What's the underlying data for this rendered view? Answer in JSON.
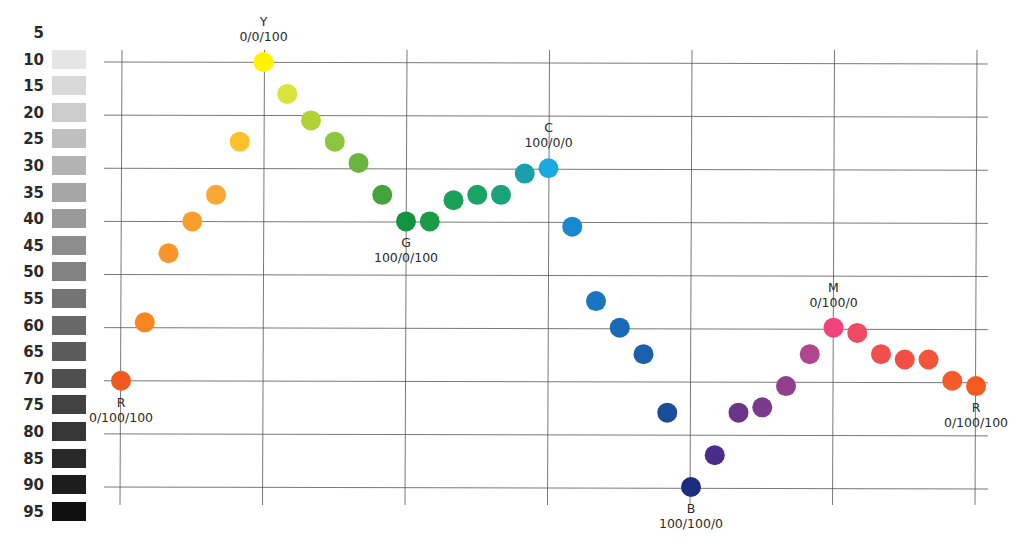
{
  "chart_data": {
    "type": "scatter",
    "title": "",
    "xlabel": "",
    "ylabel": "Lightness / grey value (%)",
    "grid": true,
    "legend": "none",
    "y_scale_labels": [
      "5",
      "10",
      "15",
      "20",
      "25",
      "30",
      "35",
      "40",
      "45",
      "50",
      "55",
      "60",
      "65",
      "70",
      "75",
      "80",
      "85",
      "90",
      "95"
    ],
    "ylim": [
      5,
      95
    ],
    "x_gridlines": 7,
    "y_gridlines": [
      10,
      20,
      30,
      40,
      50,
      60,
      70,
      80,
      90
    ],
    "annotations": [
      {
        "name": "R",
        "cmy": "0/100/100",
        "index": 0,
        "position": "below"
      },
      {
        "name": "Y",
        "cmy": "0/0/100",
        "index": 6,
        "position": "above"
      },
      {
        "name": "G",
        "cmy": "100/0/100",
        "index": 12,
        "position": "below"
      },
      {
        "name": "C",
        "cmy": "100/0/0",
        "index": 18,
        "position": "above"
      },
      {
        "name": "B",
        "cmy": "100/100/0",
        "index": 24,
        "position": "below"
      },
      {
        "name": "M",
        "cmy": "0/100/0",
        "index": 30,
        "position": "above"
      },
      {
        "name": "R",
        "cmy": "0/100/100",
        "index": 36,
        "position": "below"
      }
    ],
    "points": [
      {
        "x": 0,
        "y": 70,
        "color": "#f05a1e"
      },
      {
        "x": 1,
        "y": 59,
        "color": "#f7861f"
      },
      {
        "x": 2,
        "y": 46,
        "color": "#f8952a"
      },
      {
        "x": 3,
        "y": 40,
        "color": "#f99d2b"
      },
      {
        "x": 4,
        "y": 35,
        "color": "#faa832"
      },
      {
        "x": 5,
        "y": 25,
        "color": "#fcc12b"
      },
      {
        "x": 6,
        "y": 10,
        "color": "#fff200"
      },
      {
        "x": 7,
        "y": 16,
        "color": "#d5e33a"
      },
      {
        "x": 8,
        "y": 21,
        "color": "#b0d235"
      },
      {
        "x": 9,
        "y": 25,
        "color": "#8cc63f"
      },
      {
        "x": 10,
        "y": 29,
        "color": "#6bb43e"
      },
      {
        "x": 11,
        "y": 35,
        "color": "#45a33e"
      },
      {
        "x": 12,
        "y": 40,
        "color": "#10943f"
      },
      {
        "x": 13,
        "y": 40,
        "color": "#1b9a48"
      },
      {
        "x": 14,
        "y": 36,
        "color": "#1ba059"
      },
      {
        "x": 15,
        "y": 35,
        "color": "#1ba265"
      },
      {
        "x": 16,
        "y": 35,
        "color": "#1aa377"
      },
      {
        "x": 17,
        "y": 31,
        "color": "#1a9fab"
      },
      {
        "x": 18,
        "y": 30,
        "color": "#1aaae2"
      },
      {
        "x": 19,
        "y": 41,
        "color": "#1a88d0"
      },
      {
        "x": 20,
        "y": 55,
        "color": "#1a75c0"
      },
      {
        "x": 21,
        "y": 60,
        "color": "#1a6bb7"
      },
      {
        "x": 22,
        "y": 65,
        "color": "#1a60ad"
      },
      {
        "x": 23,
        "y": 76,
        "color": "#1a4d98"
      },
      {
        "x": 24,
        "y": 90,
        "color": "#1a2d80"
      },
      {
        "x": 25,
        "y": 84,
        "color": "#4a2d8a"
      },
      {
        "x": 26,
        "y": 76,
        "color": "#6a3488"
      },
      {
        "x": 27,
        "y": 75,
        "color": "#7a3a8c"
      },
      {
        "x": 28,
        "y": 71,
        "color": "#903f8c"
      },
      {
        "x": 29,
        "y": 65,
        "color": "#b04690"
      },
      {
        "x": 30,
        "y": 60,
        "color": "#f0437b"
      },
      {
        "x": 31,
        "y": 61,
        "color": "#f04a62"
      },
      {
        "x": 32,
        "y": 65,
        "color": "#f14f4e"
      },
      {
        "x": 33,
        "y": 66,
        "color": "#f24f42"
      },
      {
        "x": 34,
        "y": 66,
        "color": "#f3543a"
      },
      {
        "x": 35,
        "y": 70,
        "color": "#f45a2a"
      },
      {
        "x": 36,
        "y": 71,
        "color": "#f45a1e"
      }
    ]
  }
}
